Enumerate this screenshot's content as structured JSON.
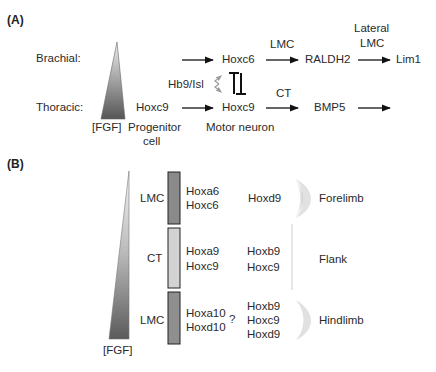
{
  "panel_a": {
    "label": "(A)",
    "rows": {
      "brachial": "Brachial:",
      "thoracic": "Thoracic:"
    },
    "gradient_label": "[FGF]",
    "progenitor": {
      "gene": "Hoxc9",
      "caption_line1": "Progenitor",
      "caption_line2": "cell"
    },
    "motor_neuron": {
      "upper_gene": "Hoxc6",
      "lower_gene": "Hoxc9",
      "caption": "Motor neuron",
      "regulator": "Hb9/Isl"
    },
    "brachial_path": {
      "edge1_label": "LMC",
      "node1": "RALDH2",
      "edge2_label_line1": "Lateral",
      "edge2_label_line2": "LMC",
      "node2": "Lim1"
    },
    "thoracic_path": {
      "edge1_label": "CT",
      "node1": "BMP5"
    }
  },
  "panel_b": {
    "label": "(B)",
    "gradient_label": "[FGF]",
    "segments": [
      {
        "column": "LMC",
        "genes_inner": [
          "Hoxa6",
          "Hoxc6"
        ],
        "genes_outer": [
          "Hoxd9"
        ],
        "target": "Forelimb",
        "bar_color": "#8a8a8a"
      },
      {
        "column": "CT",
        "genes_inner": [
          "Hoxa9",
          "Hoxc9"
        ],
        "genes_outer": [
          "Hoxb9",
          "Hoxc9"
        ],
        "target": "Flank",
        "bar_color": "#d2d2d2"
      },
      {
        "column": "LMC",
        "genes_inner": [
          "Hoxa10",
          "Hoxd10"
        ],
        "uncertain_mark": "?",
        "genes_outer": [
          "Hoxb9",
          "Hoxc9",
          "Hoxd9"
        ],
        "target": "Hindlimb",
        "bar_color": "#8f8f8f"
      }
    ]
  },
  "colors": {
    "text": "#2a2a2a",
    "arrow": "#111111",
    "gradient_dark": "#555555",
    "gradient_light": "#f2f2f2",
    "regulator_arrow": "#9a9a9a"
  }
}
